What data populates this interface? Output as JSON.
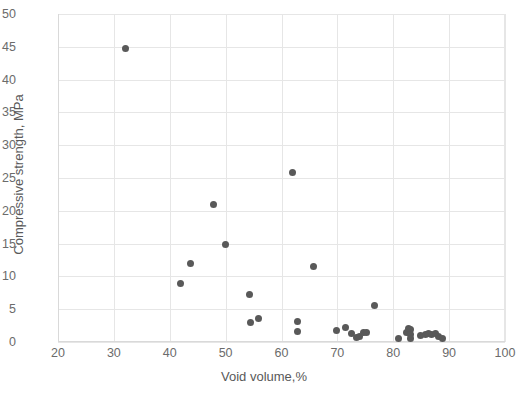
{
  "chart_data": {
    "type": "scatter",
    "title": "",
    "xlabel": "Void volume,%",
    "ylabel": "Compressive strength, MPa",
    "xlim": [
      20,
      100
    ],
    "ylim": [
      0,
      50
    ],
    "xticks": [
      20,
      30,
      40,
      50,
      60,
      70,
      80,
      90,
      100
    ],
    "yticks": [
      0,
      5,
      10,
      15,
      20,
      25,
      30,
      35,
      40,
      45,
      50
    ],
    "grid": true,
    "legend": null,
    "marker_color": "#595959",
    "gridline_color": "#e6e6e6",
    "axis_text_color": "#6b6b6b",
    "background_color": "#ffffff",
    "points": [
      {
        "x": 32.0,
        "y": 44.8
      },
      {
        "x": 42.0,
        "y": 8.9
      },
      {
        "x": 43.8,
        "y": 11.9
      },
      {
        "x": 47.8,
        "y": 21.0
      },
      {
        "x": 50.0,
        "y": 14.9
      },
      {
        "x": 54.2,
        "y": 7.2
      },
      {
        "x": 54.5,
        "y": 3.0
      },
      {
        "x": 55.8,
        "y": 3.6
      },
      {
        "x": 62.0,
        "y": 25.9
      },
      {
        "x": 62.8,
        "y": 3.1
      },
      {
        "x": 62.8,
        "y": 1.6
      },
      {
        "x": 65.8,
        "y": 11.5
      },
      {
        "x": 69.9,
        "y": 1.7
      },
      {
        "x": 71.5,
        "y": 2.2
      },
      {
        "x": 72.6,
        "y": 1.3
      },
      {
        "x": 73.4,
        "y": 0.7
      },
      {
        "x": 74.0,
        "y": 0.8
      },
      {
        "x": 74.7,
        "y": 1.5
      },
      {
        "x": 75.2,
        "y": 1.4
      },
      {
        "x": 76.7,
        "y": 5.5
      },
      {
        "x": 80.9,
        "y": 0.6
      },
      {
        "x": 82.3,
        "y": 1.5
      },
      {
        "x": 82.8,
        "y": 2.1
      },
      {
        "x": 83.0,
        "y": 1.9
      },
      {
        "x": 83.0,
        "y": 1.1
      },
      {
        "x": 83.1,
        "y": 0.5
      },
      {
        "x": 84.9,
        "y": 1.0
      },
      {
        "x": 85.8,
        "y": 1.2
      },
      {
        "x": 86.3,
        "y": 1.3
      },
      {
        "x": 86.9,
        "y": 1.1
      },
      {
        "x": 87.6,
        "y": 1.3
      },
      {
        "x": 88.1,
        "y": 0.9
      },
      {
        "x": 88.8,
        "y": 0.6
      }
    ]
  }
}
